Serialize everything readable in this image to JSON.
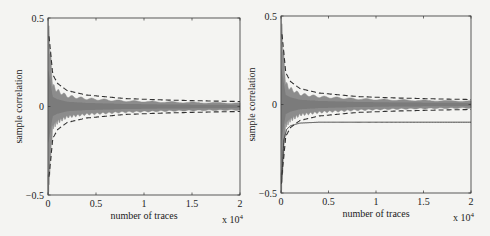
{
  "figure": {
    "background": "#f4f4f2",
    "noise_color": "#8c8c8c",
    "line_color": "#333333"
  },
  "chart_data": [
    {
      "type": "line",
      "title": "",
      "xlabel": "number of traces",
      "ylabel": "sample correlation",
      "x_multiplier": "x 10^4",
      "x_multiplier_base": "x 10",
      "x_multiplier_exp": "4",
      "xlim": [
        0,
        20000
      ],
      "ylim": [
        -0.5,
        0.5
      ],
      "xticks": [
        0,
        0.5,
        1,
        1.5,
        2
      ],
      "xtick_labels": [
        "0",
        "0.5",
        "1",
        "1.5",
        "2"
      ],
      "yticks": [
        -0.5,
        0,
        0.5
      ],
      "ytick_labels": [
        "-0.5",
        "0",
        "0.5"
      ],
      "grid": false,
      "legend": null,
      "series": [
        {
          "name": "wrong key hypotheses (gray envelope)",
          "style": "filled-noise",
          "x": [
            50,
            500,
            1000,
            2000,
            4000,
            8000,
            12000,
            16000,
            20000
          ],
          "upper": [
            0.45,
            0.12,
            0.09,
            0.06,
            0.045,
            0.032,
            0.026,
            0.022,
            0.02
          ],
          "lower": [
            -0.45,
            -0.12,
            -0.09,
            -0.06,
            -0.045,
            -0.032,
            -0.026,
            -0.022,
            -0.02
          ]
        },
        {
          "name": "upper confidence bound",
          "style": "dashed",
          "x": [
            100,
            500,
            1000,
            2000,
            4000,
            8000,
            12000,
            16000,
            20000
          ],
          "values": [
            0.4,
            0.18,
            0.13,
            0.09,
            0.065,
            0.045,
            0.037,
            0.032,
            0.028
          ]
        },
        {
          "name": "lower confidence bound",
          "style": "dashed",
          "x": [
            100,
            500,
            1000,
            2000,
            4000,
            8000,
            12000,
            16000,
            20000
          ],
          "values": [
            -0.4,
            -0.18,
            -0.13,
            -0.09,
            -0.065,
            -0.045,
            -0.037,
            -0.032,
            -0.028
          ]
        }
      ]
    },
    {
      "type": "line",
      "title": "",
      "xlabel": "number of traces",
      "ylabel": "sample correlation",
      "x_multiplier": "x 10^4",
      "x_multiplier_base": "x 10",
      "x_multiplier_exp": "4",
      "xlim": [
        0,
        20000
      ],
      "ylim": [
        -0.5,
        0.5
      ],
      "xticks": [
        0,
        0.5,
        1,
        1.5,
        2
      ],
      "xtick_labels": [
        "0",
        "0.5",
        "1",
        "1.5",
        "2"
      ],
      "yticks": [
        -0.5,
        0,
        0.5
      ],
      "ytick_labels": [
        "-0.5",
        "0",
        "0.5"
      ],
      "grid": false,
      "legend": null,
      "series": [
        {
          "name": "wrong key hypotheses (gray envelope)",
          "style": "filled-noise",
          "x": [
            50,
            500,
            1000,
            2000,
            4000,
            8000,
            12000,
            16000,
            20000
          ],
          "upper": [
            0.45,
            0.12,
            0.09,
            0.06,
            0.045,
            0.032,
            0.026,
            0.022,
            0.02
          ],
          "lower": [
            -0.45,
            -0.12,
            -0.09,
            -0.06,
            -0.045,
            -0.032,
            -0.026,
            -0.022,
            -0.02
          ]
        },
        {
          "name": "upper confidence bound",
          "style": "dashed",
          "x": [
            100,
            500,
            1000,
            2000,
            4000,
            8000,
            12000,
            16000,
            20000
          ],
          "values": [
            0.4,
            0.18,
            0.13,
            0.09,
            0.065,
            0.045,
            0.037,
            0.032,
            0.028
          ]
        },
        {
          "name": "lower confidence bound",
          "style": "dashed",
          "x": [
            100,
            500,
            1000,
            2000,
            4000,
            8000,
            12000,
            16000,
            20000
          ],
          "values": [
            -0.4,
            -0.18,
            -0.13,
            -0.09,
            -0.065,
            -0.045,
            -0.037,
            -0.032,
            -0.028
          ]
        },
        {
          "name": "correct key hypothesis",
          "style": "solid",
          "x": [
            50,
            300,
            600,
            1000,
            2000,
            4000,
            8000,
            12000,
            16000,
            20000
          ],
          "values": [
            -0.45,
            -0.2,
            -0.14,
            -0.12,
            -0.105,
            -0.1,
            -0.1,
            -0.1,
            -0.1,
            -0.1
          ]
        }
      ]
    }
  ]
}
